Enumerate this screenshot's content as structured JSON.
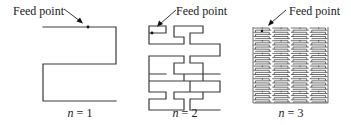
{
  "figure": {
    "panels": [
      {
        "id": "n1",
        "feed_label": "Feed point",
        "caption_var": "n",
        "caption_eq": " = 1",
        "iteration": 1
      },
      {
        "id": "n2",
        "feed_label": "Feed point",
        "caption_var": "n",
        "caption_eq": " = 2",
        "iteration": 2
      },
      {
        "id": "n3",
        "feed_label": "Feed point",
        "caption_var": "n",
        "caption_eq": " = 3",
        "iteration": 3
      }
    ],
    "colors": {
      "line": "#3a3a3a",
      "text": "#1a1a1a",
      "background": "#ffffff"
    }
  }
}
